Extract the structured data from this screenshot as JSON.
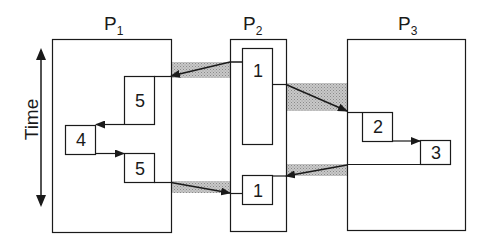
{
  "diagram": {
    "type": "process-timeline",
    "axis": {
      "label": "Time",
      "direction": "bidirectional-vertical"
    },
    "processes": [
      {
        "id": "P1",
        "label": "P",
        "subscript": "1"
      },
      {
        "id": "P2",
        "label": "P",
        "subscript": "2"
      },
      {
        "id": "P3",
        "label": "P",
        "subscript": "3"
      }
    ],
    "tasks": [
      {
        "process": "P1",
        "label": "5",
        "order": 1
      },
      {
        "process": "P1",
        "label": "4",
        "order": 2
      },
      {
        "process": "P1",
        "label": "5",
        "order": 3
      },
      {
        "process": "P2",
        "label": "1",
        "order": 1
      },
      {
        "process": "P2",
        "label": "1",
        "order": 2
      },
      {
        "process": "P3",
        "label": "2",
        "order": 1
      },
      {
        "process": "P3",
        "label": "3",
        "order": 2
      }
    ],
    "messages": [
      {
        "from": "P2.task1",
        "to": "P1.task5a"
      },
      {
        "from": "P2.task1",
        "to": "P3.task2"
      },
      {
        "from": "P1.task5b",
        "to": "P2.task1b"
      },
      {
        "from": "P3.task3",
        "to": "P2.task1b"
      }
    ],
    "colors": {
      "stroke": "#1a1a1a",
      "message_band": "#b8b8b8",
      "background": "#ffffff"
    }
  }
}
